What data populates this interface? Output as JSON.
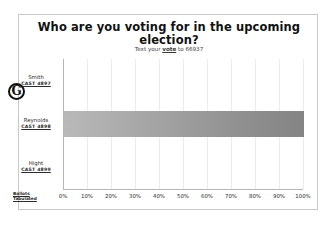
{
  "slide": {
    "title": "Who are you voting for in the upcoming election?",
    "subtitle_prefix": "Text your ",
    "subtitle_keyword": "vote",
    "subtitle_suffix": " to 66937",
    "marker": "G",
    "corner_note_line1": "Ballots",
    "corner_note_line2": "Tabulated"
  },
  "chart_data": {
    "type": "bar",
    "orientation": "horizontal",
    "title": "Who are you voting for in the upcoming election?",
    "subtitle": "Text your vote to 66937",
    "categories": [
      "Smith",
      "Reynolds",
      "Hight"
    ],
    "category_codes": [
      "CAST 4897",
      "CAST 4898",
      "CAST 4899"
    ],
    "values": [
      0,
      100,
      0
    ],
    "xlabel": "",
    "ylabel": "",
    "xlim": [
      0,
      100
    ],
    "xticks": [
      0,
      10,
      20,
      30,
      40,
      50,
      60,
      70,
      80,
      90,
      100
    ],
    "xtick_labels": [
      "0%",
      "10%",
      "20%",
      "30%",
      "40%",
      "50%",
      "60%",
      "70%",
      "80%",
      "90%",
      "100%"
    ],
    "grid": true,
    "legend": false,
    "bar_color": "#9a9a9a",
    "value_suffix": "%"
  }
}
